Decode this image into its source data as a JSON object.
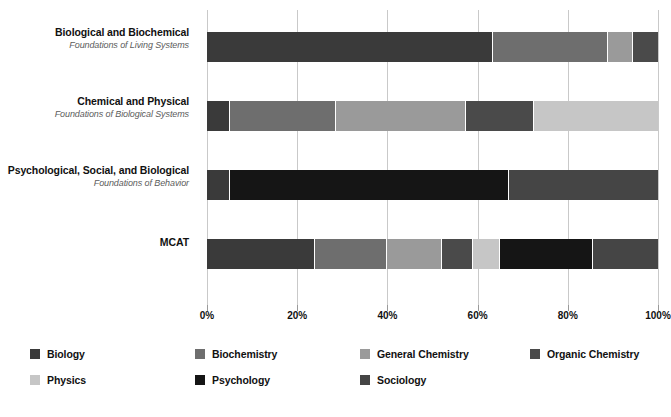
{
  "chart_data": {
    "type": "bar",
    "orientation": "horizontal",
    "stacked": true,
    "normalized": true,
    "title": "",
    "xlabel": "",
    "ylabel": "",
    "xlim": [
      0,
      100
    ],
    "grid": true,
    "legend_position": "bottom",
    "xticks": [
      "0%",
      "20%",
      "40%",
      "60%",
      "80%",
      "100%"
    ],
    "xtick_values": [
      0,
      20,
      40,
      60,
      80,
      100
    ],
    "categories": [
      "Biological and Biochemical Foundations of Living Systems",
      "Chemical and Physical Foundations of Biological Systems",
      "Psychological, Social, and Biological Foundations of Behavior",
      "MCAT"
    ],
    "series": [
      {
        "name": "Biology",
        "color": "#3a3a3a",
        "values": [
          63.5,
          5,
          5,
          24
        ]
      },
      {
        "name": "Biochemistry",
        "color": "#6e6e6e",
        "values": [
          25.5,
          23.5,
          0,
          16
        ]
      },
      {
        "name": "General Chemistry",
        "color": "#9a9a9a",
        "values": [
          5.5,
          29,
          0,
          12
        ]
      },
      {
        "name": "Organic Chemistry",
        "color": "#4a4a4a",
        "values": [
          5.5,
          15,
          0,
          7
        ]
      },
      {
        "name": "Physics",
        "color": "#c6c6c6",
        "values": [
          0,
          27.5,
          0,
          6
        ]
      },
      {
        "name": "Psychology",
        "color": "#151515",
        "values": [
          0,
          0,
          62,
          20.5
        ]
      },
      {
        "name": "Sociology",
        "color": "#454545",
        "values": [
          0,
          0,
          33,
          14.5
        ]
      }
    ]
  },
  "rows": [
    {
      "title": "Biological and Biochemical",
      "subtitle": "Foundations of Living Systems"
    },
    {
      "title": "Chemical and Physical",
      "subtitle": "Foundations of Biological Systems"
    },
    {
      "title": "Psychological, Social, and Biological",
      "subtitle": "Foundations of Behavior"
    },
    {
      "title": "MCAT",
      "subtitle": ""
    }
  ],
  "legend": [
    {
      "label": "Biology",
      "color": "#3a3a3a"
    },
    {
      "label": "Biochemistry",
      "color": "#6e6e6e"
    },
    {
      "label": "General Chemistry",
      "color": "#9a9a9a"
    },
    {
      "label": "Organic Chemistry",
      "color": "#4a4a4a"
    },
    {
      "label": "Physics",
      "color": "#c6c6c6"
    },
    {
      "label": "Psychology",
      "color": "#151515"
    },
    {
      "label": "Sociology",
      "color": "#454545"
    }
  ],
  "colors": {
    "gridline": "#c9c9c9",
    "background": "#ffffff",
    "text": "#111111",
    "subtitle_text": "#5c5c5c"
  }
}
